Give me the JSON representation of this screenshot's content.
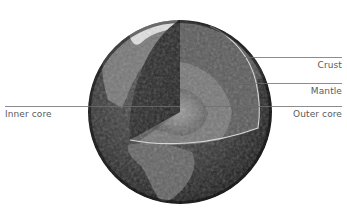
{
  "diagram": {
    "labels": {
      "crust": "Crust",
      "mantle": "Mantle",
      "outer_core": "Outer core",
      "inner_core": "Inner core"
    },
    "colors": {
      "background": "#ffffff",
      "label_text": "#5a5a5a",
      "leader_line": "#6e6e6e",
      "globe_dark": "#1c1c1c",
      "globe_mid": "#4a4a4a",
      "land_light": "#a8a8a8",
      "ice_white": "#e8e8e8",
      "cut_face_dark": "#2a2a2a",
      "mantle": "#5c5c5c",
      "outer_core": "#7a7a7a",
      "inner_core": "#8e8e8e",
      "crust_edge": "#d8d8d8"
    }
  }
}
